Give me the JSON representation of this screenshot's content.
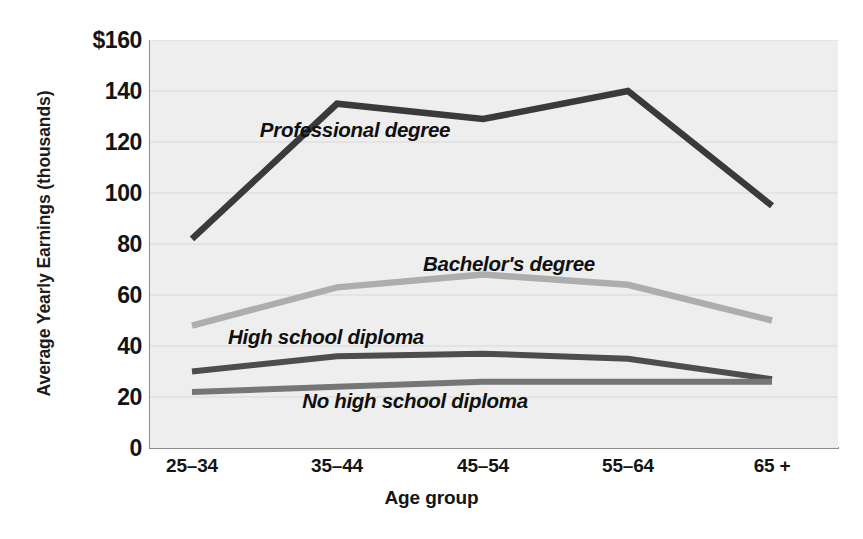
{
  "chart_data": {
    "type": "line",
    "title": "",
    "xlabel": "Age group",
    "ylabel": "Average Yearly Earnings (thousands)",
    "categories": [
      "25–34",
      "35–44",
      "45–54",
      "55–64",
      "65 +"
    ],
    "ylim": [
      0,
      160
    ],
    "yticks": [
      0,
      20,
      40,
      60,
      80,
      100,
      120,
      140,
      160
    ],
    "ytick_labels": [
      "0",
      "20",
      "40",
      "60",
      "80",
      "100",
      "120",
      "140",
      "$160"
    ],
    "grid": "horizontal",
    "legend": "inline-labels",
    "series": [
      {
        "name": "Professional degree",
        "values": [
          82,
          135,
          129,
          140,
          95
        ],
        "color": "#3a3a3a",
        "width": 6.5
      },
      {
        "name": "Bachelor's degree",
        "values": [
          48,
          63,
          68,
          64,
          50
        ],
        "color": "#adadad",
        "width": 6.5
      },
      {
        "name": "High school diploma",
        "values": [
          30,
          36,
          37,
          35,
          27
        ],
        "color": "#4d4d4d",
        "width": 6
      },
      {
        "name": "No high school diploma",
        "values": [
          22,
          24,
          26,
          26,
          26
        ],
        "color": "#767676",
        "width": 6
      }
    ],
    "annotations": [
      {
        "text": "Professional degree",
        "x_px": 355,
        "y_px": 118
      },
      {
        "text": "Bachelor's degree",
        "x_px": 509,
        "y_px": 252
      },
      {
        "text": "High school diploma",
        "x_px": 326,
        "y_px": 325
      },
      {
        "text": "No high school diploma",
        "x_px": 415,
        "y_px": 389
      }
    ]
  },
  "figure": {
    "background": "#ffffff",
    "plot_background": "#eeeeee",
    "gridline_color": "#d8d8d8",
    "axis_color": "#8e8e8e"
  }
}
